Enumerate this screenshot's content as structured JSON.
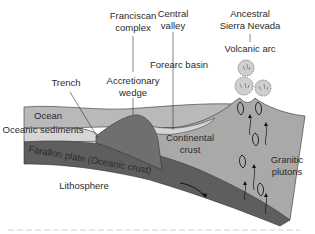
{
  "diagram": {
    "type": "geologic cross-section",
    "labels": {
      "franciscan_complex_line1": "Franciscan",
      "franciscan_complex_line2": "complex",
      "central_valley_line1": "Central",
      "central_valley_line2": "valley",
      "ancestral_line1": "Ancestral",
      "ancestral_line2": "Sierra Nevada",
      "volcanic_arc": "Volcanic arc",
      "forearc_basin": "Forearc basin",
      "trench": "Trench",
      "accretionary_line1": "Accretionary",
      "accretionary_line2": "wedge",
      "ocean": "Ocean",
      "oceanic_sediments": "Oceanic sediments",
      "farallon_plate": "Farallon plate (Oceanic crust)",
      "continental_line1": "Continental",
      "continental_line2": "crust",
      "granitic_line1": "Granitic",
      "granitic_line2": "plutons",
      "lithosphere": "Lithosphere"
    },
    "colors": {
      "ocean": "#b9b9b9",
      "sediments": "#d6d6d6",
      "plate": "#5e5e5e",
      "wedge": "#6f6f6f",
      "continental": "#a9a9a9",
      "ash": "#cfcfcf",
      "text": "#2b2b2b"
    },
    "icons": {
      "subduction_arrow": "arrow-right-curved",
      "magma_arrows": "arrow-up-wavy"
    }
  }
}
